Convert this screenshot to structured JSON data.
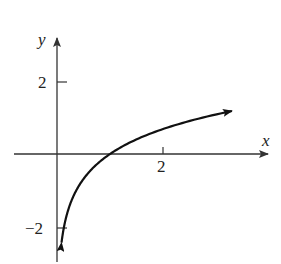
{
  "chart_data": {
    "type": "line",
    "title": "",
    "xlabel": "x",
    "ylabel": "y",
    "function": "y = ln(x)",
    "x_ticks": [
      {
        "value": 2,
        "label": "2"
      }
    ],
    "y_ticks": [
      {
        "value": 2,
        "label": "2"
      },
      {
        "value": -2,
        "label": "−2"
      }
    ],
    "xlim": [
      -0.8,
      4.0
    ],
    "ylim": [
      -3.0,
      3.4
    ],
    "grid": false,
    "legend": null,
    "series": [
      {
        "name": "y = ln(x)",
        "x": [
          0.085,
          0.1,
          0.15,
          0.2,
          0.3,
          0.4,
          0.5,
          0.7,
          1.0,
          1.5,
          2.0,
          2.5,
          3.0,
          3.3
        ],
        "y": [
          -2.47,
          -2.3,
          -1.9,
          -1.61,
          -1.2,
          -0.92,
          -0.69,
          -0.36,
          0.0,
          0.41,
          0.69,
          0.92,
          1.1,
          1.19
        ],
        "arrows": [
          "start",
          "end"
        ]
      }
    ],
    "colors": {
      "axis": "#333333",
      "curve": "#111111",
      "text": "#222222"
    }
  },
  "labels": {
    "x_axis": "x",
    "y_axis": "y",
    "x_tick_2": "2",
    "y_tick_2": "2",
    "y_tick_neg2": "−2"
  }
}
